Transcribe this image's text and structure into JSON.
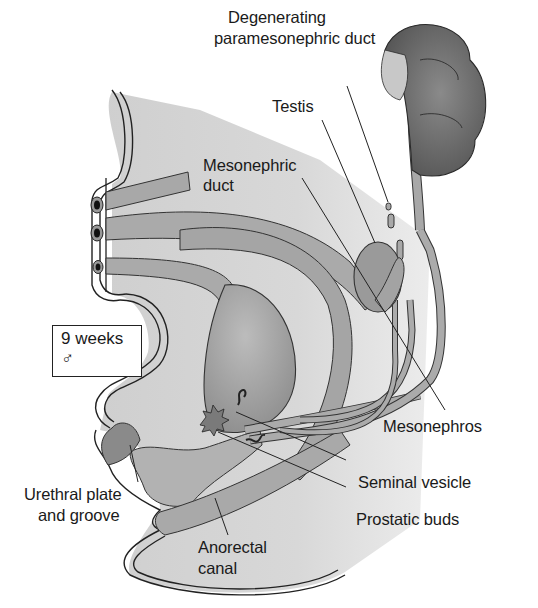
{
  "figure": {
    "stage_box": {
      "age": "9 weeks",
      "sex_symbol": "♂"
    },
    "labels": {
      "degenerating_duct": [
        "Degenerating",
        "paramesonephric duct"
      ],
      "testis": "Testis",
      "mesonephric_duct": [
        "Mesonephric",
        "duct"
      ],
      "mesonephros": "Mesonephros",
      "seminal_vesicle": "Seminal vesicle",
      "urethral_plate": [
        "Urethral plate",
        "and groove"
      ],
      "prostatic_buds": "Prostatic buds",
      "anorectal_canal": [
        "Anorectal",
        "canal"
      ]
    },
    "colors": {
      "tissue_fill": "#bdbdbd",
      "duct_fill": "#a9a9a9",
      "organ_dark": "#7a7a7a",
      "outline": "#2a2a2a",
      "background": "#ffffff"
    }
  }
}
